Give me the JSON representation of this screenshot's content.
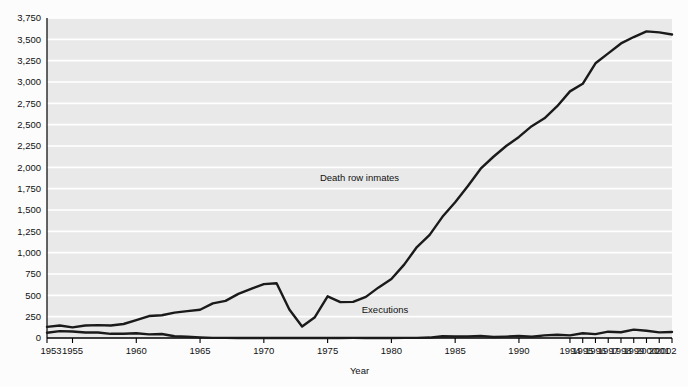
{
  "chart_data": {
    "type": "line",
    "title": "",
    "subtitle": "",
    "xlabel": "Year",
    "ylabel": "",
    "xlim": [
      1953,
      2002
    ],
    "ylim": [
      0,
      3750
    ],
    "grid": true,
    "grid_orientation": "horizontal",
    "legend_position": "inline-annotation",
    "background_color": "#e9e9e9",
    "line_color": "#1a1a1a",
    "gridline_color": "#ffffff",
    "axis_color": "#000000",
    "x_tick_labels": [
      "1953",
      "1955",
      "1960",
      "1965",
      "1970",
      "1975",
      "1980",
      "1985",
      "1990",
      "1994",
      "1995",
      "1996",
      "1997",
      "1998",
      "1999",
      "2000",
      "2001",
      "2002"
    ],
    "x_tick_values": [
      1953,
      1955,
      1960,
      1965,
      1970,
      1975,
      1980,
      1985,
      1990,
      1994,
      1995,
      1996,
      1997,
      1998,
      1999,
      2000,
      2001,
      2002
    ],
    "y_tick_labels": [
      "0",
      "250",
      "500",
      "750",
      "1,000",
      "1,250",
      "1,500",
      "1,750",
      "2,000",
      "2,250",
      "2,500",
      "2,750",
      "3,000",
      "3,250",
      "3,500",
      "3,750"
    ],
    "y_tick_values": [
      0,
      250,
      500,
      750,
      1000,
      1250,
      1500,
      1750,
      2000,
      2250,
      2500,
      2750,
      3000,
      3250,
      3500,
      3750
    ],
    "annotations": [
      {
        "text": "Death row inmates",
        "x": 1977.5,
        "y": 1840
      },
      {
        "text": "Executions",
        "x": 1979.5,
        "y": 290
      }
    ],
    "x": [
      1953,
      1954,
      1955,
      1956,
      1957,
      1958,
      1959,
      1960,
      1961,
      1962,
      1963,
      1964,
      1965,
      1966,
      1967,
      1968,
      1969,
      1970,
      1971,
      1972,
      1973,
      1974,
      1975,
      1976,
      1977,
      1978,
      1979,
      1980,
      1981,
      1982,
      1983,
      1984,
      1985,
      1986,
      1987,
      1988,
      1989,
      1990,
      1991,
      1992,
      1993,
      1994,
      1995,
      1996,
      1997,
      1998,
      1999,
      2000,
      2001,
      2002
    ],
    "series": [
      {
        "name": "Death row inmates",
        "values": [
          131,
          147,
          125,
          146,
          151,
          147,
          164,
          210,
          257,
          267,
          297,
          315,
          331,
          406,
          435,
          517,
          575,
          631,
          642,
          334,
          134,
          244,
          488,
          420,
          423,
          482,
          593,
          691,
          860,
          1066,
          1209,
          1420,
          1591,
          1781,
          1984,
          2124,
          2250,
          2356,
          2482,
          2575,
          2716,
          2890,
          2979,
          3219,
          3335,
          3452,
          3527,
          3593,
          3581,
          3557
        ]
      },
      {
        "name": "Executions",
        "values": [
          62,
          81,
          76,
          65,
          65,
          49,
          49,
          56,
          42,
          47,
          21,
          15,
          7,
          1,
          2,
          0,
          0,
          0,
          0,
          0,
          0,
          0,
          0,
          0,
          1,
          0,
          2,
          0,
          1,
          2,
          5,
          21,
          18,
          18,
          25,
          11,
          16,
          23,
          14,
          31,
          38,
          31,
          56,
          45,
          74,
          68,
          98,
          85,
          66,
          71
        ]
      }
    ]
  }
}
